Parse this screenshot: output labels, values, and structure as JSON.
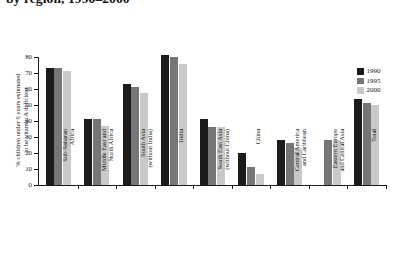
{
  "figure": {
    "title": "by region, 1990–2000",
    "title_note_clipped": true
  },
  "legend": {
    "position": "top-right",
    "entries": [
      {
        "label": "1990",
        "color": "#1b1b1b"
      },
      {
        "label": "1995",
        "color": "#767676"
      },
      {
        "label": "2000",
        "color": "#c9c9c9"
      }
    ]
  },
  "yaxis": {
    "title_line1": "% children under 6 years estimated",
    "title_line2": "to be vitamin A deficient",
    "ticks": [
      "0",
      "10",
      "20",
      "30",
      "40",
      "50",
      "60",
      "70",
      "80"
    ]
  },
  "chart_data": {
    "type": "bar",
    "title": "by region, 1990–2000",
    "xlabel": "",
    "ylabel": "% children under 6 years estimated to be vitamin A deficient",
    "ylim": [
      0,
      80
    ],
    "yticks": [
      0,
      10,
      20,
      30,
      40,
      50,
      60,
      70,
      80
    ],
    "grid": false,
    "legend_position": "upper right",
    "categories": [
      "Sub-Saharan Africa",
      "Middle East and North Africa",
      "South Asia (without India)",
      "India",
      "South East Asia (without China)",
      "China",
      "Central America and Caribbean",
      "Eastern Europe and Central Asia",
      "Total"
    ],
    "series": [
      {
        "name": "1990",
        "color": "#1b1b1b",
        "values": [
          73,
          41,
          63,
          81,
          41,
          20,
          28,
          null,
          54
        ]
      },
      {
        "name": "1995",
        "color": "#767676",
        "values": [
          73,
          41.5,
          61,
          80,
          36,
          11,
          26,
          28,
          51
        ]
      },
      {
        "name": "2000",
        "color": "#c9c9c9",
        "values": [
          71,
          37,
          57.5,
          75.5,
          36,
          7,
          23,
          28,
          50
        ]
      }
    ]
  }
}
